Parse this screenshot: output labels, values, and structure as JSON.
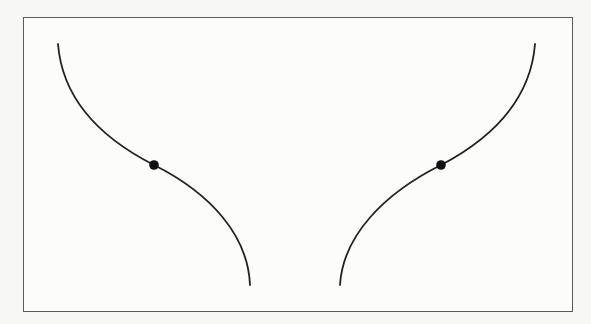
{
  "figure": {
    "type": "diagram",
    "frame": {
      "x": 23,
      "y": 17,
      "width": 550,
      "height": 295,
      "stroke": "#5a5a5a"
    },
    "curves": [
      {
        "name": "left-curve",
        "start": [
          58,
          44
        ],
        "inflection_point": [
          154,
          165
        ],
        "end": [
          250,
          285
        ],
        "stroke": "#222222"
      },
      {
        "name": "right-curve",
        "start": [
          535,
          44
        ],
        "inflection_point": [
          441,
          165
        ],
        "end": [
          340,
          285
        ],
        "stroke": "#222222"
      }
    ],
    "marker_color": "#111111",
    "background_color": "#f7f7f5"
  }
}
